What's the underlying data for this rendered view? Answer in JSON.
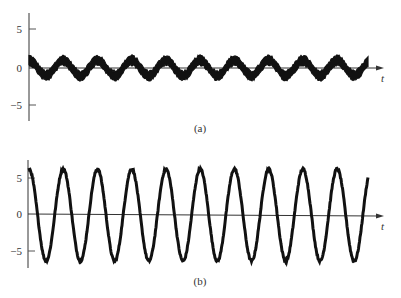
{
  "chart_data": [
    {
      "id": "a",
      "type": "line",
      "panel_label": "(a)",
      "title": "",
      "xlabel": "t",
      "ylabel": "",
      "yticks": [
        5,
        0,
        -5
      ],
      "ytick_labels": [
        "5",
        "0",
        "−5"
      ],
      "ylim": [
        -7.5,
        7.5
      ],
      "grid": false,
      "legend": null,
      "description": "Noisy sinusoid: small-amplitude sine wave buried in noise",
      "series": [
        {
          "name": "noisy signal",
          "amplitude": 1.0,
          "noise_amplitude": 0.75,
          "periods_visible": 9.9,
          "phase": "starts near +1 (cosine-like)",
          "peaks_approx": 1.0,
          "troughs_approx": -1.0
        }
      ]
    },
    {
      "id": "b",
      "type": "line",
      "panel_label": "(b)",
      "title": "",
      "xlabel": "t",
      "ylabel": "",
      "yticks": [
        5,
        0,
        -5
      ],
      "ytick_labels": [
        "5",
        "0",
        "−5"
      ],
      "ylim": [
        -7.5,
        7.5
      ],
      "grid": false,
      "legend": null,
      "description": "Amplified / filtered sinusoid with slight residual noise",
      "series": [
        {
          "name": "output signal",
          "amplitude": 6.3,
          "noise_amplitude": 0.3,
          "periods_visible": 9.9,
          "phase": "starts at peak (cosine-like)",
          "peaks_approx": 6.5,
          "troughs_approx": -6.5
        }
      ]
    }
  ],
  "panels": {
    "a": {
      "label": "(a)",
      "t_label": "t",
      "ticks": [
        "5",
        "0",
        "−5"
      ]
    },
    "b": {
      "label": "(b)",
      "t_label": "t",
      "ticks": [
        "5",
        "0",
        "−5"
      ]
    }
  }
}
